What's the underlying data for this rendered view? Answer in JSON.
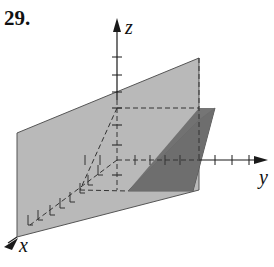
{
  "figure": {
    "problem_number": "29.",
    "axes": {
      "x_label": "x",
      "y_label": "y",
      "z_label": "z"
    },
    "colors": {
      "background": "#ffffff",
      "light_plane": "#b9b9b9",
      "dark_plane": "#6e6e6e",
      "axis": "#1a1a1a",
      "dashes": "#333333"
    }
  }
}
